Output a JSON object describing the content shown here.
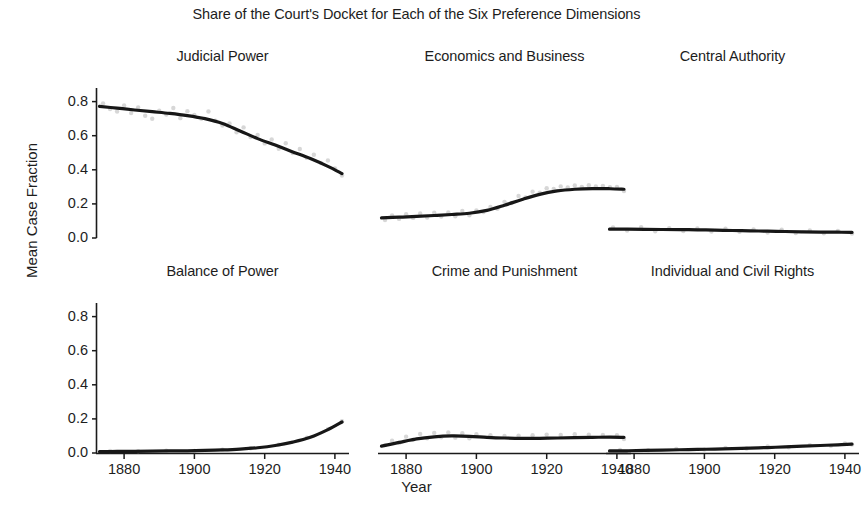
{
  "figure": {
    "title": "Share of the Court's Docket for Each of the Six Preference Dimensions",
    "xlabel": "Year",
    "ylabel": "Mean Case Fraction"
  },
  "axis": {
    "ytick_labels": [
      "0.8",
      "0.6",
      "0.4",
      "0.2",
      "0.0"
    ],
    "xtick_labels": [
      "1880",
      "1900",
      "1920",
      "1940"
    ]
  },
  "chart_data": {
    "type": "line",
    "title": "Share of the Court's Docket for Each of the Six Preference Dimensions",
    "xlabel": "Year",
    "ylabel": "Mean Case Fraction",
    "xlim": [
      1872,
      1944
    ],
    "ylim": [
      0.0,
      0.88
    ],
    "xticks": [
      1880,
      1900,
      1920,
      1940
    ],
    "yticks": [
      0.0,
      0.2,
      0.4,
      0.6,
      0.8
    ],
    "grid": false,
    "legend": "none",
    "layout": {
      "rows": 2,
      "cols": 3
    },
    "panels": [
      {
        "title": "Judicial Power",
        "row": 0,
        "col": 0,
        "series": [
          {
            "name": "Judicial Power trend",
            "x": [
              1873,
              1878,
              1883,
              1888,
              1893,
              1898,
              1903,
              1908,
              1913,
              1918,
              1923,
              1928,
              1933,
              1938,
              1942
            ],
            "values": [
              0.772,
              0.762,
              0.751,
              0.741,
              0.731,
              0.718,
              0.7,
              0.672,
              0.628,
              0.583,
              0.545,
              0.505,
              0.466,
              0.42,
              0.378
            ]
          }
        ],
        "scatter": {
          "x": [
            1874,
            1876,
            1878,
            1880,
            1882,
            1884,
            1886,
            1888,
            1890,
            1892,
            1894,
            1896,
            1898,
            1900,
            1902,
            1904,
            1906,
            1908,
            1910,
            1912,
            1914,
            1916,
            1918,
            1920,
            1922,
            1924,
            1926,
            1928,
            1930,
            1932,
            1934,
            1936,
            1938,
            1940,
            1942
          ],
          "values": [
            0.79,
            0.757,
            0.742,
            0.778,
            0.733,
            0.766,
            0.717,
            0.7,
            0.747,
            0.724,
            0.763,
            0.703,
            0.744,
            0.722,
            0.7,
            0.742,
            0.688,
            0.66,
            0.672,
            0.62,
            0.649,
            0.592,
            0.604,
            0.555,
            0.578,
            0.524,
            0.556,
            0.498,
            0.522,
            0.47,
            0.488,
            0.44,
            0.455,
            0.408,
            0.366
          ]
        }
      },
      {
        "title": "Economics and Business",
        "row": 0,
        "col": 1,
        "series": [
          {
            "name": "Economics and Business trend",
            "x": [
              1873,
              1878,
              1883,
              1888,
              1893,
              1898,
              1903,
              1908,
              1913,
              1918,
              1923,
              1928,
              1933,
              1938,
              1942
            ],
            "values": [
              0.118,
              0.122,
              0.127,
              0.132,
              0.138,
              0.145,
              0.162,
              0.192,
              0.226,
              0.256,
              0.276,
              0.286,
              0.29,
              0.289,
              0.286
            ]
          }
        ],
        "scatter": {
          "x": [
            1874,
            1876,
            1878,
            1880,
            1882,
            1884,
            1886,
            1888,
            1890,
            1892,
            1894,
            1896,
            1898,
            1900,
            1902,
            1904,
            1906,
            1908,
            1910,
            1912,
            1914,
            1916,
            1918,
            1920,
            1922,
            1924,
            1926,
            1928,
            1930,
            1932,
            1934,
            1936,
            1938,
            1940,
            1942
          ],
          "values": [
            0.105,
            0.132,
            0.112,
            0.14,
            0.118,
            0.144,
            0.12,
            0.148,
            0.126,
            0.15,
            0.128,
            0.158,
            0.133,
            0.162,
            0.152,
            0.182,
            0.172,
            0.212,
            0.205,
            0.246,
            0.238,
            0.272,
            0.266,
            0.292,
            0.288,
            0.302,
            0.296,
            0.308,
            0.3,
            0.31,
            0.302,
            0.306,
            0.298,
            0.3,
            0.276
          ]
        }
      },
      {
        "title": "Central Authority",
        "row": 0,
        "col": 2,
        "series": [
          {
            "name": "Central Authority trend",
            "x": [
              1873,
              1878,
              1883,
              1888,
              1893,
              1898,
              1903,
              1908,
              1913,
              1918,
              1923,
              1928,
              1933,
              1938,
              1942
            ],
            "values": [
              0.052,
              0.052,
              0.051,
              0.05,
              0.049,
              0.048,
              0.046,
              0.044,
              0.042,
              0.04,
              0.038,
              0.036,
              0.035,
              0.034,
              0.033
            ]
          }
        ],
        "scatter": {
          "x": [
            1874,
            1878,
            1882,
            1886,
            1890,
            1894,
            1898,
            1902,
            1906,
            1910,
            1914,
            1918,
            1922,
            1926,
            1930,
            1934,
            1938,
            1942
          ],
          "values": [
            0.062,
            0.044,
            0.064,
            0.04,
            0.058,
            0.041,
            0.056,
            0.038,
            0.055,
            0.036,
            0.05,
            0.032,
            0.048,
            0.029,
            0.044,
            0.028,
            0.042,
            0.026
          ]
        }
      },
      {
        "title": "Balance of Power",
        "row": 1,
        "col": 0,
        "series": [
          {
            "name": "Balance of Power trend",
            "x": [
              1873,
              1878,
              1883,
              1888,
              1893,
              1898,
              1903,
              1908,
              1913,
              1918,
              1923,
              1928,
              1933,
              1938,
              1942
            ],
            "values": [
              0.008,
              0.009,
              0.01,
              0.011,
              0.012,
              0.013,
              0.015,
              0.018,
              0.023,
              0.031,
              0.044,
              0.064,
              0.092,
              0.137,
              0.182
            ]
          }
        ],
        "scatter": {
          "x": [
            1876,
            1884,
            1892,
            1900,
            1908,
            1916,
            1924,
            1932,
            1938,
            1942
          ],
          "values": [
            0.012,
            0.01,
            0.014,
            0.012,
            0.02,
            0.028,
            0.048,
            0.09,
            0.14,
            0.186
          ]
        }
      },
      {
        "title": "Crime and Punishment",
        "row": 1,
        "col": 1,
        "series": [
          {
            "name": "Crime and Punishment trend",
            "x": [
              1873,
              1878,
              1883,
              1888,
              1893,
              1898,
              1903,
              1908,
              1913,
              1918,
              1923,
              1928,
              1933,
              1938,
              1942
            ],
            "values": [
              0.04,
              0.062,
              0.083,
              0.095,
              0.1,
              0.098,
              0.092,
              0.088,
              0.086,
              0.086,
              0.088,
              0.09,
              0.092,
              0.093,
              0.092
            ]
          }
        ],
        "scatter": {
          "x": [
            1874,
            1876,
            1878,
            1880,
            1882,
            1884,
            1886,
            1888,
            1890,
            1892,
            1894,
            1896,
            1898,
            1900,
            1904,
            1908,
            1912,
            1916,
            1920,
            1924,
            1928,
            1932,
            1936,
            1940,
            1942
          ],
          "values": [
            0.046,
            0.072,
            0.058,
            0.096,
            0.078,
            0.112,
            0.086,
            0.118,
            0.092,
            0.12,
            0.09,
            0.116,
            0.086,
            0.11,
            0.104,
            0.1,
            0.102,
            0.104,
            0.108,
            0.106,
            0.11,
            0.108,
            0.106,
            0.104,
            0.082
          ]
        }
      },
      {
        "title": "Individual and Civil Rights",
        "row": 1,
        "col": 2,
        "series": [
          {
            "name": "Individual and Civil Rights trend",
            "x": [
              1873,
              1878,
              1883,
              1888,
              1893,
              1898,
              1903,
              1908,
              1913,
              1918,
              1923,
              1928,
              1933,
              1938,
              1942
            ],
            "values": [
              0.012,
              0.013,
              0.015,
              0.017,
              0.019,
              0.021,
              0.023,
              0.026,
              0.029,
              0.032,
              0.036,
              0.04,
              0.044,
              0.048,
              0.052
            ]
          }
        ],
        "scatter": {
          "x": [
            1876,
            1884,
            1892,
            1900,
            1906,
            1912,
            1918,
            1924,
            1930,
            1936,
            1940,
            1942
          ],
          "values": [
            0.018,
            0.016,
            0.024,
            0.02,
            0.03,
            0.026,
            0.038,
            0.034,
            0.046,
            0.042,
            0.056,
            0.05
          ]
        }
      }
    ]
  }
}
